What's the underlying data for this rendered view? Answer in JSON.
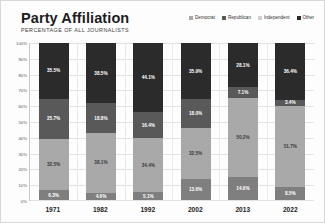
{
  "header": {
    "title": "Party Affiliation",
    "subtitle": "PERCENTAGE OF ALL JOURNALISTS"
  },
  "chart_data": {
    "type": "bar",
    "subtype": "stacked-100",
    "title": "Party Affiliation",
    "subtitle": "PERCENTAGE OF ALL JOURNALISTS",
    "xlabel": "",
    "ylabel": "",
    "ylim": [
      0,
      100
    ],
    "grid": true,
    "legend_position": "top-right",
    "categories": [
      "1971",
      "1982",
      "1992",
      "2002",
      "2013",
      "2022"
    ],
    "y_ticks": [
      "0%",
      "10%",
      "20%",
      "30%",
      "40%",
      "50%",
      "60%",
      "70%",
      "80%",
      "90%",
      "100%"
    ],
    "series": [
      {
        "name": "Democrat",
        "color": "#a9a9a9",
        "values": [
          32.5,
          38.1,
          34.4,
          32.5,
          50.2,
          51.7
        ],
        "labels": [
          "32.5%",
          "38.1%",
          "34.4%",
          "32.5%",
          "50.2%",
          "51.7%"
        ]
      },
      {
        "name": "Republican",
        "color": "#595959",
        "values": [
          25.7,
          18.8,
          16.4,
          18.0,
          7.1,
          3.4
        ],
        "labels": [
          "25.7%",
          "18.8%",
          "16.4%",
          "18.0%",
          "7.1%",
          "3.4%"
        ]
      },
      {
        "name": "Independent",
        "color": "#2b2b2b",
        "values": [
          35.5,
          38.5,
          44.1,
          35.9,
          28.1,
          36.4
        ],
        "labels": [
          "35.5%",
          "38.5%",
          "44.1%",
          "35.9%",
          "28.1%",
          "36.4%"
        ]
      },
      {
        "name": "Other",
        "color": "#7f7f7f",
        "values": [
          6.3,
          4.6,
          5.1,
          13.6,
          14.6,
          8.5
        ],
        "labels": [
          "6.3%",
          "4.6%",
          "5.1%",
          "13.6%",
          "14.6%",
          "8.5%"
        ]
      }
    ],
    "stack_order_bottom_to_top": [
      "Other",
      "Democrat",
      "Republican",
      "Independent"
    ]
  },
  "legend": {
    "items": [
      {
        "label": "Democrat",
        "color": "#a9a9a9"
      },
      {
        "label": "Republican",
        "color": "#595959"
      },
      {
        "label": "Independent",
        "color": "#cfcfcf"
      },
      {
        "label": "Other",
        "color": "#2b2b2b"
      }
    ]
  }
}
